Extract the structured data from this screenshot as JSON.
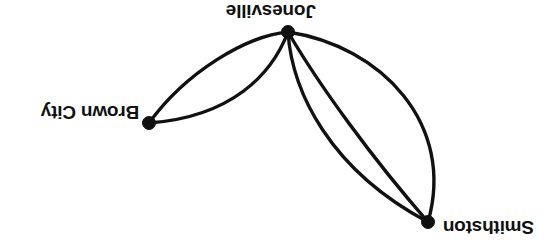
{
  "figure": {
    "kind": "undirected-multigraph-diagram",
    "background_color": "#ffffff",
    "stroke_color": "#111111",
    "canvas": {
      "width": 553,
      "height": 251
    },
    "orientation_note": "rendered upside-down (rotated 180 degrees)"
  },
  "nodes": [
    {
      "id": "jonesville",
      "label": "Jonesville",
      "x": 288,
      "y": 32,
      "label_position": "above"
    },
    {
      "id": "brown-city",
      "label": "Brown City",
      "x": 149,
      "y": 123,
      "label_position": "left"
    },
    {
      "id": "smithston",
      "label": "Smithston",
      "x": 428,
      "y": 222,
      "label_position": "right"
    }
  ],
  "edges": [
    {
      "from": "jonesville",
      "to": "brown-city",
      "curve": "upper-arc"
    },
    {
      "from": "jonesville",
      "to": "brown-city",
      "curve": "lower-arc"
    },
    {
      "from": "jonesville",
      "to": "smithston",
      "curve": "left-arc"
    },
    {
      "from": "jonesville",
      "to": "smithston",
      "curve": "middle-arc"
    },
    {
      "from": "jonesville",
      "to": "smithston",
      "curve": "right-arc"
    }
  ],
  "edge_counts": {
    "jonesville_brown_city": 2,
    "jonesville_smithston": 3,
    "brown_city_smithston": 0
  }
}
